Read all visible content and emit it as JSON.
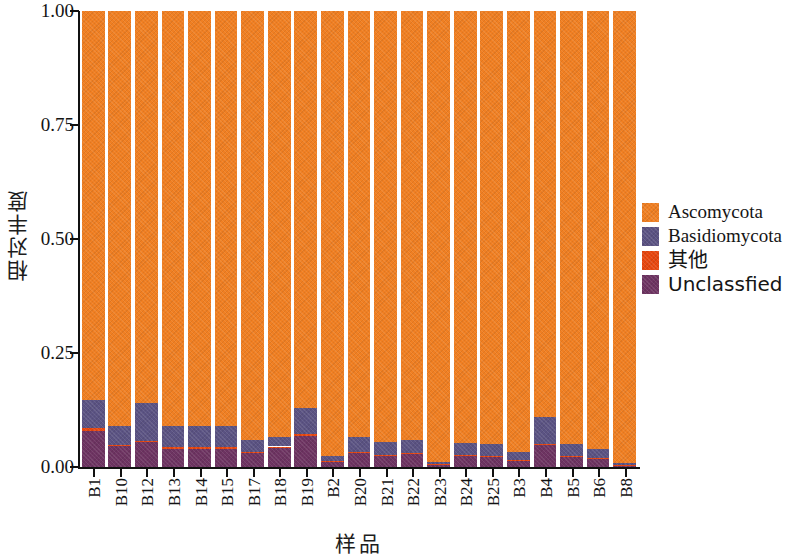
{
  "chart_data": {
    "type": "bar",
    "subtype": "stacked-bar",
    "title": "",
    "xlabel": "样品",
    "ylabel": "相对丰度",
    "ylim": [
      0,
      1.0
    ],
    "ytick_labels": [
      "0.00",
      "0.25",
      "0.50",
      "0.75",
      "1.00"
    ],
    "ytick_values": [
      0.0,
      0.25,
      0.5,
      0.75,
      1.0
    ],
    "grid": false,
    "legend_position": "right",
    "categories": [
      "B1",
      "B10",
      "B12",
      "B13",
      "B14",
      "B15",
      "B17",
      "B18",
      "B19",
      "B2",
      "B20",
      "B21",
      "B22",
      "B23",
      "B24",
      "B25",
      "B3",
      "B4",
      "B5",
      "B6",
      "B8"
    ],
    "series": [
      {
        "name": "Unclassfied",
        "color": "#6E3462",
        "values": [
          0.08,
          0.045,
          0.055,
          0.04,
          0.04,
          0.04,
          0.03,
          0.042,
          0.068,
          0.012,
          0.03,
          0.025,
          0.028,
          0.006,
          0.025,
          0.022,
          0.014,
          0.048,
          0.022,
          0.018,
          0.004
        ]
      },
      {
        "name": "其他",
        "color": "#E8470F",
        "values": [
          0.006,
          0.003,
          0.003,
          0.003,
          0.003,
          0.003,
          0.002,
          0.003,
          0.004,
          0.001,
          0.002,
          0.002,
          0.002,
          0.001,
          0.002,
          0.002,
          0.001,
          0.003,
          0.002,
          0.002,
          0.001
        ]
      },
      {
        "name": "Basidiomycota",
        "color": "#5B5383",
        "values": [
          0.062,
          0.042,
          0.082,
          0.047,
          0.047,
          0.047,
          0.028,
          0.02,
          0.058,
          0.012,
          0.033,
          0.028,
          0.03,
          0.005,
          0.025,
          0.026,
          0.017,
          0.059,
          0.026,
          0.02,
          0.003
        ]
      },
      {
        "name": "Ascomycota",
        "color": "#F07F22",
        "values": [
          0.852,
          0.91,
          0.86,
          0.91,
          0.91,
          0.91,
          0.94,
          0.935,
          0.87,
          0.975,
          0.935,
          0.945,
          0.94,
          0.988,
          0.948,
          0.95,
          0.968,
          0.89,
          0.95,
          0.96,
          0.992
        ]
      }
    ],
    "legend": [
      {
        "label": "Ascomycota",
        "color": "#F07F22",
        "cjk": false
      },
      {
        "label": "Basidiomycota",
        "color": "#5B5383",
        "cjk": false
      },
      {
        "label": "其他",
        "color": "#E8470F",
        "cjk": true
      },
      {
        "label": "Unclassfied",
        "color": "#6E3462",
        "cjk": true
      }
    ]
  }
}
